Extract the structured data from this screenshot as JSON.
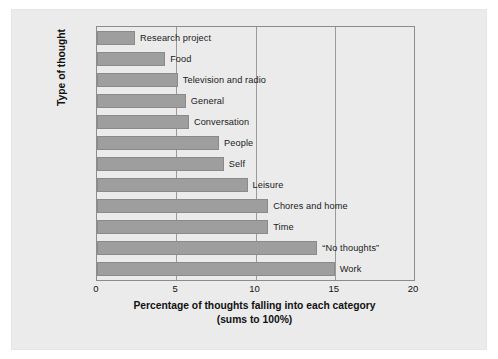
{
  "chart_data": {
    "type": "bar",
    "orientation": "horizontal",
    "title": "",
    "xlabel_line1": "Percentage of thoughts falling into each category",
    "xlabel_line2": "(sums to 100%)",
    "ylabel": "Type of thought",
    "xlim": [
      0,
      20
    ],
    "xticks": [
      0,
      5,
      10,
      15,
      20
    ],
    "xtick_labels": [
      "0",
      "5",
      "10",
      "15",
      "20"
    ],
    "grid": "vertical gridlines at 5, 10, 15",
    "legend": null,
    "bar_color": "#9e9e9e",
    "bar_edge_color": "#8a8a8a",
    "categories": [
      "Research project",
      "Food",
      "Television and radio",
      "General",
      "Conversation",
      "People",
      "Self",
      "Leisure",
      "Chores and home",
      "Time",
      "“No thoughts”",
      "Work"
    ],
    "values": [
      2.4,
      4.3,
      5.1,
      5.6,
      5.8,
      7.7,
      8.0,
      9.5,
      10.8,
      10.8,
      13.9,
      15.0
    ],
    "bars": [
      {
        "label": "Research project",
        "value": 2.4
      },
      {
        "label": "Food",
        "value": 4.3
      },
      {
        "label": "Television and radio",
        "value": 5.1
      },
      {
        "label": "General",
        "value": 5.6
      },
      {
        "label": "Conversation",
        "value": 5.8
      },
      {
        "label": "People",
        "value": 7.7
      },
      {
        "label": "Self",
        "value": 8.0
      },
      {
        "label": "Leisure",
        "value": 9.5
      },
      {
        "label": "Chores and home",
        "value": 10.8
      },
      {
        "label": "Time",
        "value": 10.8
      },
      {
        "label": "“No thoughts”",
        "value": 13.9
      },
      {
        "label": "Work",
        "value": 15.0
      }
    ]
  },
  "colors": {
    "figure_background": "#ffffff",
    "panel_background": "#ebebeb",
    "axis_line": "#8c8c8c",
    "gridline": "#9a9a9a",
    "text": "#111111"
  }
}
